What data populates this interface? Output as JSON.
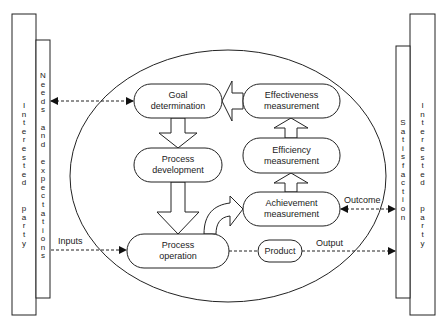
{
  "left": {
    "outer_label": "Interested party",
    "inner_label": "Needs and expectations"
  },
  "right": {
    "inner_label": "Satisfaction",
    "outer_label": "Interested party"
  },
  "nodes": {
    "goal": {
      "line1": "Goal",
      "line2": "determination"
    },
    "effectiveness": {
      "line1": "Effectiveness",
      "line2": "measurement"
    },
    "efficiency": {
      "line1": "Efficiency",
      "line2": "measurement"
    },
    "development": {
      "line1": "Process",
      "line2": "development"
    },
    "achievement": {
      "line1": "Achievement",
      "line2": "measurement"
    },
    "operation": {
      "line1": "Process",
      "line2": "operation"
    },
    "product": {
      "line1": "Product"
    }
  },
  "edges": {
    "inputs": "Inputs",
    "outcome": "Outcome",
    "output": "Output"
  },
  "vertical": {
    "left_outer": "I\nn\nt\ne\nr\ne\ns\nt\ne\nd\n\n\np\na\nr\nt\ny",
    "left_inner": "N\ne\ne\nd\ns\n\na\nn\nd\n\ne\nx\np\ne\nc\nt\na\nt\ni\no\nn\ns",
    "right_inner": "S\na\nt\ni\ns\nf\na\nc\nt\ni\no\nn",
    "right_outer": "I\nn\nt\ne\nr\ne\ns\nt\ne\nd\n\n\np\na\nr\nt\ny"
  }
}
